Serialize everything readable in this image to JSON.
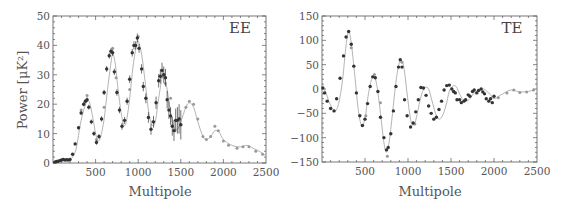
{
  "chart_data": [
    {
      "type": "scatter",
      "title": "EE",
      "panel_label": "EE",
      "xlabel": "Multipole",
      "ylabel": "Power [μK²]",
      "xlim": [
        0,
        2500
      ],
      "ylim": [
        0,
        50
      ],
      "xticks": [
        500,
        1000,
        1500,
        2000,
        2500
      ],
      "yticks": [
        0,
        10,
        20,
        30,
        40,
        50
      ],
      "grid": false,
      "legend": null,
      "model_curve": {
        "x": [
          2,
          50,
          100,
          150,
          200,
          250,
          280,
          320,
          360,
          400,
          430,
          470,
          500,
          530,
          560,
          600,
          640,
          680,
          700,
          730,
          760,
          800,
          830,
          860,
          900,
          940,
          980,
          1000,
          1040,
          1080,
          1120,
          1160,
          1200,
          1240,
          1280,
          1300,
          1340,
          1380,
          1420,
          1460,
          1500,
          1560,
          1600,
          1650,
          1700,
          1760,
          1800,
          1850,
          1900,
          1950,
          2000,
          2100,
          2200,
          2280,
          2350,
          2420,
          2500
        ],
        "y": [
          0.2,
          0.5,
          0.8,
          0.9,
          1.2,
          3,
          6,
          13,
          18,
          21,
          20.5,
          15,
          10,
          7.5,
          9,
          15,
          25,
          34,
          37,
          34,
          26,
          17,
          13,
          14,
          22,
          33,
          40,
          41.5,
          37,
          28,
          18,
          13,
          14,
          22,
          29,
          30,
          25,
          17,
          12,
          11.5,
          14,
          19,
          20.5,
          19,
          14,
          9,
          8,
          9,
          11,
          10.5,
          8,
          6,
          5.5,
          6,
          5,
          4,
          2.5
        ]
      },
      "series": [
        {
          "name": "Dark data points (with error bars)",
          "color": "#333333",
          "x": [
            20,
            40,
            60,
            80,
            100,
            120,
            140,
            160,
            180,
            200,
            230,
            260,
            300,
            330,
            360,
            380,
            400,
            420,
            450,
            480,
            510,
            540,
            570,
            600,
            630,
            660,
            680,
            700,
            720,
            750,
            780,
            810,
            840,
            870,
            900,
            930,
            950,
            970,
            990,
            1010,
            1040,
            1060,
            1090,
            1120,
            1150,
            1180,
            1210,
            1240,
            1260,
            1280,
            1300,
            1320,
            1340,
            1360,
            1380,
            1400,
            1420,
            1440,
            1460,
            1480,
            1500
          ],
          "y": [
            0.3,
            0.5,
            0.6,
            0.8,
            1.0,
            1.2,
            1.0,
            1.1,
            1.0,
            1.2,
            3,
            6.5,
            12,
            17,
            20,
            21,
            21.5,
            19,
            14,
            10,
            7,
            9,
            15,
            24,
            32,
            36.5,
            38,
            37.5,
            31,
            24,
            18,
            12.5,
            14.5,
            21,
            28.5,
            37.5,
            40,
            40,
            42.5,
            39,
            32,
            26,
            22,
            15.5,
            11.5,
            14,
            20.5,
            28,
            29.5,
            31.5,
            30,
            29,
            21.5,
            18,
            16,
            12.5,
            11,
            14.5,
            14.5,
            15,
            13
          ],
          "error": [
            0.3,
            0.3,
            0.3,
            0.3,
            0.3,
            0.3,
            0.3,
            0.3,
            0.3,
            0.3,
            0.4,
            0.5,
            0.6,
            0.6,
            0.7,
            0.7,
            0.8,
            0.8,
            0.8,
            0.8,
            0.8,
            0.8,
            0.9,
            0.9,
            1.0,
            1.0,
            1.0,
            1.1,
            1.1,
            1.1,
            1.1,
            1.2,
            1.2,
            1.2,
            1.3,
            1.3,
            1.4,
            1.4,
            1.5,
            1.5,
            1.6,
            1.6,
            1.7,
            1.8,
            1.9,
            2.0,
            2.1,
            2.3,
            2.5,
            2.6,
            2.8,
            3.0,
            3.0,
            3.0,
            3.0,
            3.2,
            3.5,
            4.0,
            4.5,
            5.0,
            5.0
          ]
        },
        {
          "name": "Light data points",
          "color": "#999999",
          "x": [
            330,
            400,
            510,
            600,
            700,
            740,
            900,
            1000,
            1170,
            1320,
            1380,
            1500,
            1560,
            1600,
            1650,
            1700,
            1760,
            1800,
            1850,
            1900,
            1940,
            2000,
            2060,
            2160,
            2230,
            2300,
            2380,
            2460
          ],
          "y": [
            18,
            23,
            8,
            19,
            39,
            29,
            25,
            43,
            14,
            27,
            22,
            13,
            19,
            21,
            20,
            15,
            9,
            8,
            9,
            12.5,
            11,
            7.5,
            6,
            5,
            5.5,
            5.5,
            4,
            3
          ]
        }
      ]
    },
    {
      "type": "scatter",
      "title": "TE",
      "panel_label": "TE",
      "xlabel": "Multipole",
      "ylabel": "",
      "xlim": [
        0,
        2500
      ],
      "ylim": [
        -150,
        150
      ],
      "xticks": [
        500,
        1000,
        1500,
        2000,
        2500
      ],
      "yticks": [
        -150,
        -100,
        -50,
        0,
        50,
        100,
        150
      ],
      "grid": false,
      "legend": null,
      "model_curve": {
        "x": [
          2,
          40,
          80,
          120,
          160,
          200,
          240,
          280,
          310,
          340,
          380,
          420,
          460,
          500,
          540,
          580,
          610,
          640,
          680,
          720,
          750,
          780,
          820,
          860,
          900,
          930,
          960,
          1000,
          1040,
          1080,
          1120,
          1160,
          1200,
          1240,
          1280,
          1320,
          1360,
          1400,
          1440,
          1480,
          1520,
          1560,
          1600,
          1640,
          1680,
          1720,
          1760,
          1800,
          1840,
          1880,
          1920,
          1960,
          2000,
          2100,
          2200,
          2300,
          2400,
          2500
        ],
        "y": [
          5,
          -5,
          -25,
          -40,
          -45,
          -25,
          20,
          90,
          118,
          95,
          30,
          -40,
          -75,
          -60,
          -10,
          22,
          25,
          5,
          -50,
          -110,
          -130,
          -110,
          -50,
          15,
          55,
          58,
          35,
          -25,
          -70,
          -70,
          -40,
          -10,
          3,
          0,
          -25,
          -50,
          -62,
          -55,
          -35,
          -5,
          6,
          5,
          -10,
          -22,
          -25,
          -20,
          -10,
          -5,
          -2,
          0,
          -5,
          -12,
          -20,
          -10,
          -2,
          -6,
          -5,
          0
        ]
      },
      "series": [
        {
          "name": "Dark data points",
          "color": "#333333",
          "x": [
            10,
            30,
            60,
            100,
            140,
            170,
            210,
            250,
            280,
            310,
            340,
            370,
            400,
            440,
            470,
            500,
            530,
            560,
            590,
            620,
            650,
            680,
            720,
            750,
            770,
            800,
            830,
            860,
            890,
            910,
            930,
            960,
            990,
            1030,
            1060,
            1090,
            1120,
            1150,
            1180,
            1210,
            1240,
            1270,
            1300,
            1330,
            1360,
            1390,
            1420,
            1450,
            1480,
            1510,
            1530,
            1550,
            1570,
            1600,
            1620,
            1650,
            1670,
            1700,
            1720,
            1750,
            1770,
            1800,
            1820,
            1850,
            1870,
            1890,
            1910,
            1940,
            1960,
            1980,
            2000
          ],
          "y": [
            2,
            -8,
            -25,
            -40,
            -45,
            -20,
            22,
            68,
            107,
            118,
            92,
            47,
            -8,
            -55,
            -75,
            -62,
            -30,
            5,
            25,
            23,
            -5,
            -58,
            -100,
            -125,
            -120,
            -92,
            -45,
            5,
            45,
            60,
            45,
            -22,
            -55,
            -78,
            -70,
            -47,
            -22,
            3,
            2,
            -13,
            -35,
            -50,
            -62,
            -58,
            -42,
            -25,
            -2,
            7,
            8,
            0,
            -5,
            -8,
            -22,
            -22,
            -28,
            -25,
            -22,
            -12,
            -15,
            -5,
            -2,
            -8,
            -3,
            0,
            -6,
            -10,
            -20,
            -25,
            -20,
            -28,
            -15
          ]
        },
        {
          "name": "Light data points",
          "color": "#999999",
          "x": [
            340,
            510,
            610,
            680,
            760,
            930,
            1080,
            2050,
            2150,
            2230,
            2300,
            2380,
            2460
          ],
          "y": [
            85,
            -55,
            30,
            -28,
            -138,
            55,
            -72,
            -18,
            -8,
            -2,
            -7,
            -6,
            -2
          ]
        }
      ]
    }
  ],
  "panels": {
    "ee": {
      "label": "EE",
      "xlabel": "Multipole",
      "ylabel": "Power [μK²]"
    },
    "te": {
      "label": "TE",
      "xlabel": "Multipole"
    }
  }
}
